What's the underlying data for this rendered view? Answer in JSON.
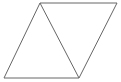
{
  "figure": {
    "name": "parallelogram-split-into-two-triangles",
    "canvas": {
      "width": 121,
      "height": 82,
      "background_color": "#ffffff"
    },
    "style": {
      "stroke_color": "#666666",
      "stroke_width": 1,
      "fill_color": "none"
    },
    "vertices": [
      {
        "label": "bottom-left",
        "x": 4,
        "y": 78
      },
      {
        "label": "top-left",
        "x": 40,
        "y": 3
      },
      {
        "label": "top-right",
        "x": 117,
        "y": 3
      },
      {
        "label": "bottom-right",
        "x": 79,
        "y": 78
      }
    ],
    "outline_points": "4,78 40,3 117,3 79,78",
    "diagonal": {
      "name": "interior-diagonal",
      "x1": 40,
      "y1": 3,
      "x2": 79,
      "y2": 78
    },
    "edges": [
      {
        "name": "left-edge",
        "from": "bottom-left",
        "to": "top-left"
      },
      {
        "name": "top-edge",
        "from": "top-left",
        "to": "top-right"
      },
      {
        "name": "right-edge",
        "from": "top-right",
        "to": "bottom-right"
      },
      {
        "name": "bottom-edge",
        "from": "bottom-right",
        "to": "bottom-left"
      }
    ],
    "regions": [
      {
        "name": "left-triangle",
        "points": "4,78 40,3 79,78"
      },
      {
        "name": "right-triangle",
        "points": "40,3 117,3 79,78"
      }
    ]
  }
}
